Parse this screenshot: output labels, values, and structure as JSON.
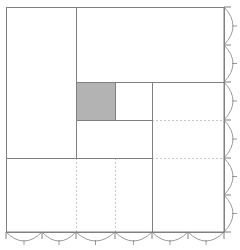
{
  "figure": {
    "title": "",
    "type": "mosaic-treemap-partition",
    "background": "#ffffff",
    "line_color": "#808080",
    "axis_color": "#808080",
    "dotted_color": "#c8c8c8",
    "highlight_color": "#b3b3b3",
    "highlight_stroke": "#6e6e6e"
  },
  "chart_data": {
    "type": "treemap",
    "title": "",
    "xlabel": "",
    "ylabel": "",
    "xlim": [
      0,
      1
    ],
    "ylim": [
      0,
      1
    ],
    "grid": false,
    "legend": null,
    "plot_frame": {
      "x0": 6,
      "y0": 7,
      "x1": 224,
      "y1": 232
    },
    "highlighted_cell": {
      "label": "",
      "x": [
        0.321,
        0.5
      ],
      "y": [
        0.667,
        0.833
      ],
      "px": {
        "x0": 76,
        "y0": 82,
        "x1": 115,
        "y1": 120
      },
      "fill": "#b3b3b3"
    },
    "partition_rects": [
      {
        "name": "top-left-block",
        "px": {
          "x0": 6,
          "y0": 7,
          "x1": 76,
          "y1": 158
        }
      },
      {
        "name": "top-right-block",
        "px": {
          "x0": 76,
          "y0": 7,
          "x1": 224,
          "y1": 82
        }
      },
      {
        "name": "highlight-cell",
        "px": {
          "x0": 76,
          "y0": 82,
          "x1": 115,
          "y1": 120
        }
      },
      {
        "name": "mid-right-cell",
        "px": {
          "x0": 115,
          "y0": 82,
          "x1": 152,
          "y1": 120
        }
      },
      {
        "name": "mid-lower-cell",
        "px": {
          "x0": 76,
          "y0": 120,
          "x1": 152,
          "y1": 158
        }
      },
      {
        "name": "right-column-cell",
        "px": {
          "x0": 152,
          "y0": 82,
          "x1": 224,
          "y1": 232
        }
      },
      {
        "name": "bottom-left-cell",
        "px": {
          "x0": 6,
          "y0": 158,
          "x1": 152,
          "y1": 232
        }
      }
    ],
    "solid_segments": [
      {
        "name": "frame-top",
        "orient": "h",
        "y": 7,
        "x0": 6,
        "x1": 224
      },
      {
        "name": "frame-left",
        "orient": "v",
        "x": 6,
        "y0": 7,
        "y1": 232
      },
      {
        "name": "frame-right",
        "orient": "v",
        "x": 224,
        "y0": 7,
        "y1": 232
      },
      {
        "name": "frame-bottom",
        "orient": "h",
        "y": 232,
        "x0": 6,
        "x1": 224
      },
      {
        "name": "vline-a",
        "orient": "v",
        "x": 76,
        "y0": 7,
        "y1": 158
      },
      {
        "name": "vline-b",
        "orient": "v",
        "x": 115,
        "y0": 82,
        "y1": 120
      },
      {
        "name": "vline-c",
        "orient": "v",
        "x": 152,
        "y0": 82,
        "y1": 232
      },
      {
        "name": "hline-a",
        "orient": "h",
        "y": 82,
        "x0": 76,
        "x1": 224
      },
      {
        "name": "hline-b",
        "orient": "h",
        "y": 120,
        "x0": 76,
        "x1": 152
      },
      {
        "name": "hline-c",
        "orient": "h",
        "y": 158,
        "x0": 6,
        "x1": 152
      }
    ],
    "dotted_segments": [
      {
        "name": "dotted-h-upper",
        "orient": "h",
        "y": 120,
        "x0": 152,
        "x1": 224
      },
      {
        "name": "dotted-h-lower",
        "orient": "h",
        "y": 158,
        "x0": 152,
        "x1": 224
      },
      {
        "name": "dotted-v-left",
        "orient": "v",
        "x": 76,
        "y0": 158,
        "y1": 232
      },
      {
        "name": "dotted-v-right",
        "orient": "v",
        "x": 115,
        "y0": 158,
        "y1": 232
      }
    ],
    "bottom_axis": {
      "name": "bottom-axis",
      "y": 232,
      "x0": 6,
      "x1": 224,
      "major_ticks": [
        6,
        42,
        76,
        115,
        152,
        188,
        224
      ],
      "minor_ticks": [
        24,
        59,
        95,
        133,
        170,
        206
      ],
      "arc_depth": 9,
      "major_tick_len": 7,
      "minor_tick_len": 4,
      "tick_labels": []
    },
    "right_axis": {
      "name": "right-axis",
      "x": 224,
      "y0": 7,
      "y1": 232,
      "major_ticks": [
        7,
        45,
        82,
        120,
        158,
        195,
        232
      ],
      "minor_ticks": [
        26,
        63,
        101,
        139,
        176,
        213
      ],
      "arc_depth": 9,
      "major_tick_len": 7,
      "minor_tick_len": 4,
      "tick_labels": []
    }
  }
}
